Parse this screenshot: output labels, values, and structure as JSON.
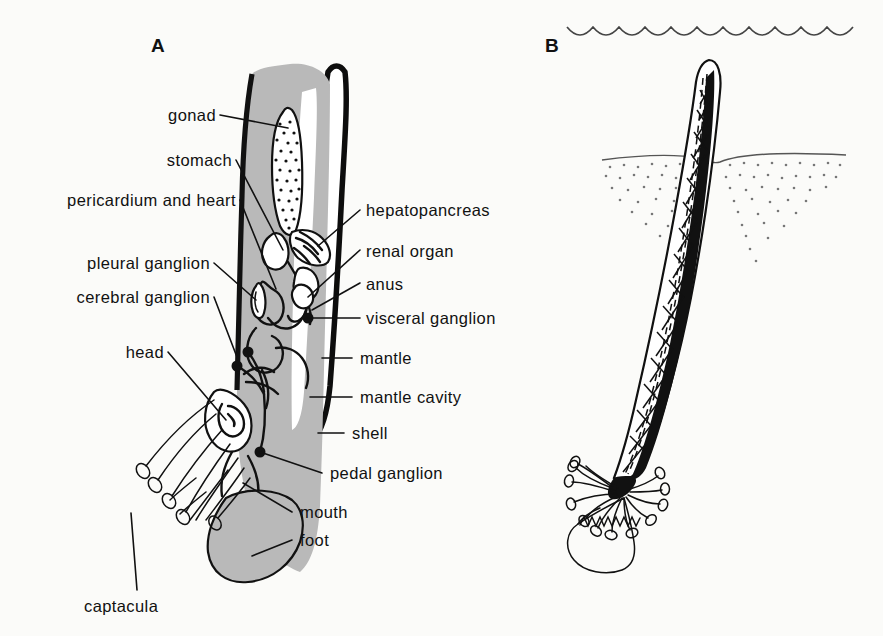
{
  "figure": {
    "background_color": "#fbfbf9",
    "ink_color": "#111111",
    "tissue_color": "#b9b9b9"
  },
  "panels": [
    {
      "id": "A",
      "letter": "A",
      "caption": "longitudinal section of a scaphopod showing internal anatomy"
    },
    {
      "id": "B",
      "letter": "B",
      "caption": "scaphopod in life position buried in sediment below the water surface"
    }
  ],
  "panel_a": {
    "letter": "A",
    "labels_left": [
      {
        "key": "gonad",
        "text": "gonad"
      },
      {
        "key": "stomach",
        "text": "stomach"
      },
      {
        "key": "pericardium_heart",
        "text": "pericardium and heart"
      },
      {
        "key": "pleural_ganglion",
        "text": "pleural ganglion"
      },
      {
        "key": "cerebral_ganglion",
        "text": "cerebral ganglion"
      },
      {
        "key": "head",
        "text": "head"
      },
      {
        "key": "captacula",
        "text": "captacula"
      }
    ],
    "labels_right": [
      {
        "key": "hepatopancreas",
        "text": "hepatopancreas"
      },
      {
        "key": "renal_organ",
        "text": "renal organ"
      },
      {
        "key": "anus",
        "text": "anus"
      },
      {
        "key": "visceral_ganglion",
        "text": "visceral ganglion"
      },
      {
        "key": "mantle",
        "text": "mantle"
      },
      {
        "key": "mantle_cavity",
        "text": "mantle cavity"
      },
      {
        "key": "shell",
        "text": "shell"
      },
      {
        "key": "pedal_ganglion",
        "text": "pedal ganglion"
      },
      {
        "key": "mouth",
        "text": "mouth"
      },
      {
        "key": "foot",
        "text": "foot"
      }
    ]
  },
  "panel_b": {
    "letter": "B",
    "features": [
      {
        "key": "water-surface",
        "name": "water surface"
      },
      {
        "key": "sediment",
        "name": "sediment"
      },
      {
        "key": "tusk-shell",
        "name": "tusk shell"
      },
      {
        "key": "captacula",
        "name": "captacula"
      },
      {
        "key": "foot",
        "name": "foot"
      }
    ]
  }
}
